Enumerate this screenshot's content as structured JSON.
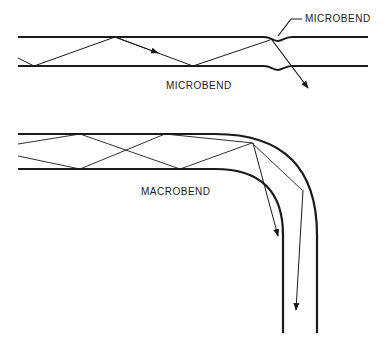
{
  "labels": {
    "microbend_top": "MICROBEND",
    "microbend_bottom": "MICROBEND",
    "macrobend": "MACROBEND"
  },
  "colors": {
    "line": "#1a1a1a",
    "background": "#ffffff"
  }
}
